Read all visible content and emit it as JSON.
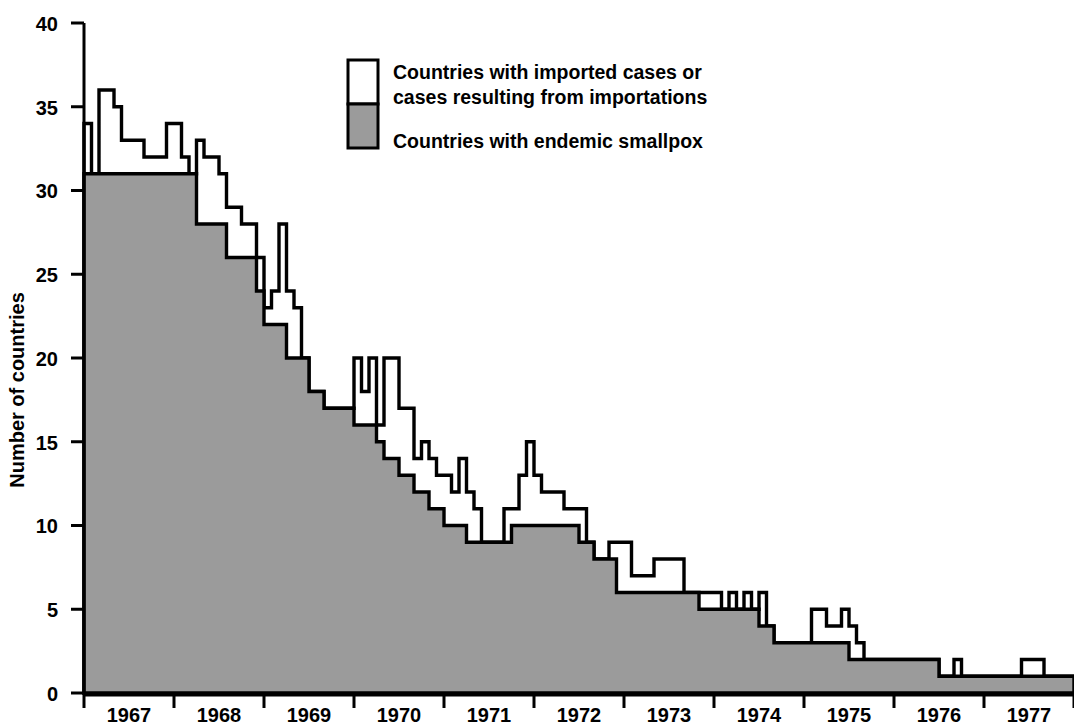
{
  "chart_data": {
    "type": "area",
    "title": "",
    "xlabel": "",
    "ylabel": "Number of countries",
    "ylim": [
      0,
      40
    ],
    "yticks": [
      0,
      5,
      10,
      15,
      20,
      25,
      30,
      35,
      40
    ],
    "xticklabels": [
      "1967",
      "1968",
      "1969",
      "1970",
      "1971",
      "1972",
      "1973",
      "1974",
      "1975",
      "1976",
      "1977"
    ],
    "xlim": [
      1967.0,
      1978.0
    ],
    "grid": false,
    "legend_position": "top-center",
    "step_interpolation": "post",
    "x_resolution": "monthly",
    "colors": {
      "endemic_fill": "#9b9b9b",
      "imported_fill": "#ffffff",
      "outline": "#000000",
      "background": "#ffffff"
    },
    "series": [
      {
        "name": "Countries with endemic smallpox",
        "fill": "#9b9b9b",
        "values": [
          31,
          31,
          31,
          31,
          31,
          31,
          31,
          31,
          31,
          31,
          31,
          31,
          31,
          31,
          31,
          28,
          28,
          28,
          28,
          26,
          26,
          26,
          26,
          24,
          22,
          22,
          22,
          20,
          20,
          20,
          18,
          18,
          17,
          17,
          17,
          17,
          16,
          16,
          16,
          15,
          14,
          14,
          13,
          13,
          12,
          12,
          11,
          11,
          10,
          10,
          10,
          9,
          9,
          9,
          9,
          9,
          9,
          10,
          10,
          10,
          10,
          10,
          10,
          10,
          10,
          10,
          9,
          9,
          8,
          8,
          8,
          6,
          6,
          6,
          6,
          6,
          6,
          6,
          6,
          6,
          6,
          6,
          5,
          5,
          5,
          5,
          5,
          5,
          5,
          5,
          4,
          4,
          3,
          3,
          3,
          3,
          3,
          3,
          3,
          3,
          3,
          3,
          2,
          2,
          2,
          2,
          2,
          2,
          2,
          2,
          2,
          2,
          2,
          2,
          1,
          1,
          1,
          1,
          1,
          1,
          1,
          1,
          1,
          1,
          1,
          1,
          1,
          1,
          1,
          1,
          1,
          1
        ]
      },
      {
        "name": "Countries with imported cases or cases resulting from importations",
        "fill": "#ffffff",
        "values": [
          34,
          31,
          36,
          36,
          35,
          33,
          33,
          33,
          32,
          32,
          32,
          34,
          34,
          32,
          31,
          33,
          32,
          32,
          31,
          29,
          29,
          28,
          28,
          26,
          23,
          24,
          28,
          24,
          23,
          20,
          18,
          18,
          17,
          17,
          17,
          17,
          20,
          18,
          20,
          16,
          20,
          20,
          17,
          17,
          14,
          15,
          14,
          13,
          13,
          12,
          14,
          12,
          11,
          9,
          9,
          9,
          11,
          11,
          13,
          15,
          13,
          12,
          12,
          12,
          11,
          11,
          11,
          9,
          8,
          8,
          9,
          9,
          9,
          7,
          7,
          7,
          8,
          8,
          8,
          8,
          6,
          6,
          6,
          6,
          6,
          5,
          6,
          5,
          6,
          5,
          6,
          4,
          3,
          3,
          3,
          3,
          3,
          5,
          5,
          4,
          4,
          5,
          4,
          3,
          2,
          2,
          2,
          2,
          2,
          2,
          2,
          2,
          2,
          2,
          1,
          1,
          2,
          1,
          1,
          1,
          1,
          1,
          1,
          1,
          1,
          2,
          2,
          2,
          1,
          1,
          1,
          1
        ]
      }
    ]
  },
  "legend": {
    "items": [
      {
        "id": "imported",
        "swatch": "#ffffff",
        "line1": "Countries with imported cases or",
        "line2": "cases resulting from importations"
      },
      {
        "id": "endemic",
        "swatch": "#9b9b9b",
        "line1": "Countries with endemic smallpox",
        "line2": ""
      }
    ]
  },
  "axes": {
    "y_title": "Number of countries",
    "y_ticks": [
      "40",
      "35",
      "30",
      "25",
      "20",
      "15",
      "10",
      "5",
      "0"
    ],
    "x_ticks": [
      "1967",
      "1968",
      "1969",
      "1970",
      "1971",
      "1972",
      "1973",
      "1974",
      "1975",
      "1976",
      "1977"
    ]
  }
}
